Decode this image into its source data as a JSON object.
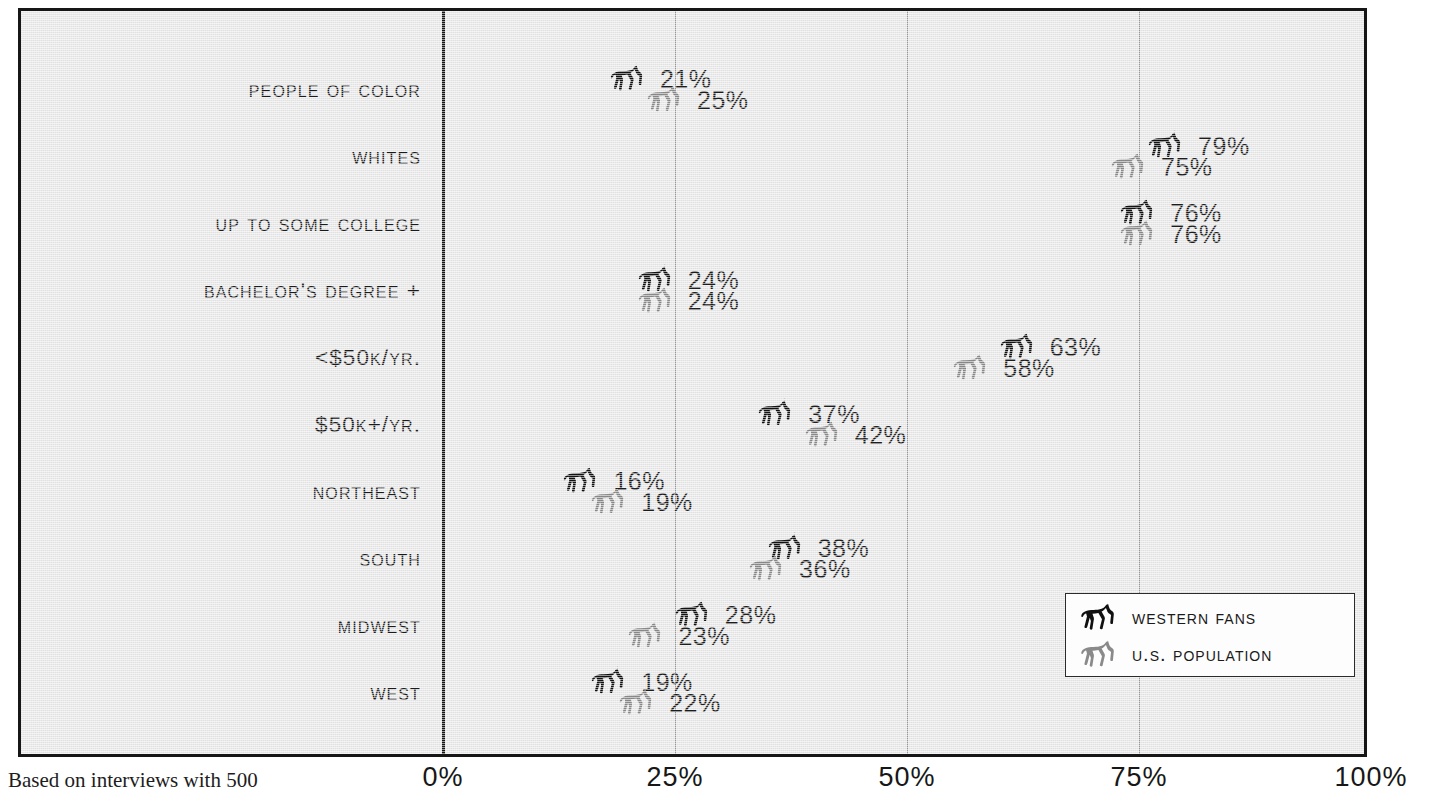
{
  "chart_data": {
    "type": "bar",
    "title": "",
    "xlabel": "",
    "ylabel": "",
    "orientation": "horizontal",
    "xlim": [
      0,
      100
    ],
    "xticks": [
      "0%",
      "25%",
      "50%",
      "75%",
      "100%"
    ],
    "xtick_values": [
      0,
      25,
      50,
      75,
      100
    ],
    "grid": true,
    "legend_position": "bottom-right",
    "categories": [
      "People of Color",
      "Whites",
      "Up to Some College",
      "Bachelor's Degree +",
      "<$50K/yr.",
      "$50K+/yr.",
      "Northeast",
      "South",
      "Midwest",
      "West"
    ],
    "series": [
      {
        "name": "Western Fans",
        "marker": "black-horse",
        "values": [
          21,
          79,
          76,
          24,
          63,
          37,
          16,
          38,
          28,
          19
        ],
        "labels": [
          "21%",
          "79%",
          "76%",
          "24%",
          "63%",
          "37%",
          "16%",
          "38%",
          "28%",
          "19%"
        ]
      },
      {
        "name": "U.S. Population",
        "marker": "gray-horse",
        "values": [
          25,
          75,
          76,
          24,
          58,
          42,
          19,
          36,
          23,
          22
        ],
        "labels": [
          "25%",
          "75%",
          "76%",
          "24%",
          "58%",
          "42%",
          "19%",
          "36%",
          "23%",
          "22%"
        ]
      }
    ],
    "footnote": "Based on interviews with 500"
  },
  "legend": {
    "items": [
      {
        "label": "Western Fans",
        "marker": "black-horse-icon",
        "color": "#111111"
      },
      {
        "label": "U.S. Population",
        "marker": "gray-horse-icon",
        "color": "#8a8a8a"
      }
    ]
  },
  "colors": {
    "background": "#e9e9e9",
    "frame": "#161616",
    "axis": "#141414",
    "gridline": "#9a9a9a",
    "text": "#1a1a1a",
    "series_fans": "#0a0a0a",
    "series_population": "#8a8a8a",
    "legend_background": "#fdfdfd"
  }
}
